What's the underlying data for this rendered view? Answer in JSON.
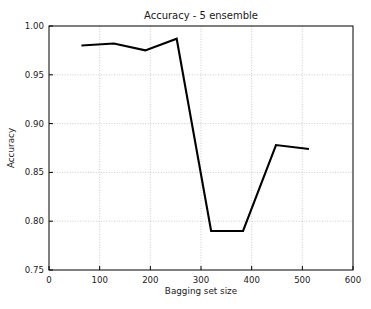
{
  "figure": {
    "background_color": "#ffffff",
    "width": 371,
    "height": 309
  },
  "chart_data": {
    "type": "line",
    "title": "Accuracy - 5 ensemble",
    "xlabel": "Bagging set size",
    "ylabel": "Accuracy",
    "xlim": [
      0,
      600
    ],
    "ylim": [
      0.75,
      1.0
    ],
    "xticks": [
      0,
      100,
      200,
      300,
      400,
      500,
      600
    ],
    "xtick_labels": [
      "0",
      "100",
      "200",
      "300",
      "400",
      "500",
      "600"
    ],
    "yticks": [
      0.75,
      0.8,
      0.85,
      0.9,
      0.95,
      1.0
    ],
    "ytick_labels": [
      "0.75",
      "0.80",
      "0.85",
      "0.90",
      "0.95",
      "1.00"
    ],
    "grid": true,
    "grid_style": "dotted",
    "grid_color": "#b5b5b5",
    "legend": "none",
    "series": [
      {
        "name": "Accuracy",
        "color": "#000000",
        "line_width": 2.1,
        "x": [
          64,
          128,
          190,
          252,
          320,
          383,
          448,
          513
        ],
        "values": [
          0.98,
          0.982,
          0.975,
          0.987,
          0.79,
          0.79,
          0.878,
          0.874
        ]
      }
    ]
  }
}
